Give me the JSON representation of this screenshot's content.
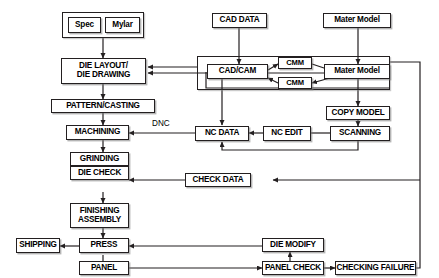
{
  "diagram": {
    "type": "flowchart",
    "colors": {
      "background": "#ffffff",
      "stroke": "#231f20",
      "text": "#000000",
      "shadow": "#8c8c8c"
    },
    "annotations": [
      {
        "id": "dnc",
        "text": "DNC"
      }
    ],
    "nodes": [
      {
        "id": "spec",
        "label": "Spec"
      },
      {
        "id": "mylar",
        "label": "Mylar"
      },
      {
        "id": "die-layout",
        "label_line1": "DIE LAYOUT/",
        "label_line2": "DIE DRAWING"
      },
      {
        "id": "pattern-casting",
        "label": "PATTERN/CASTING"
      },
      {
        "id": "machining",
        "label": "MACHINING"
      },
      {
        "id": "grinding",
        "label": "GRINDING"
      },
      {
        "id": "die-check",
        "label": "DIE CHECK"
      },
      {
        "id": "finishing",
        "label_line1": "FINISHING",
        "label_line2": "ASSEMBLY"
      },
      {
        "id": "shipping",
        "label": "SHIPPING"
      },
      {
        "id": "press",
        "label": "PRESS"
      },
      {
        "id": "panel",
        "label": "PANEL"
      },
      {
        "id": "cad-data",
        "label": "CAD DATA"
      },
      {
        "id": "mater-model-top",
        "label": "Mater Model"
      },
      {
        "id": "cad-cam",
        "label": "CAD/CAM"
      },
      {
        "id": "cmm-upper",
        "label": "CMM"
      },
      {
        "id": "cmm-lower",
        "label": "CMM"
      },
      {
        "id": "mater-model-mid",
        "label": "Mater Model"
      },
      {
        "id": "copy-model",
        "label": "COPY MODEL"
      },
      {
        "id": "scanning",
        "label": "SCANNING"
      },
      {
        "id": "nc-edit",
        "label": "NC EDIT"
      },
      {
        "id": "nc-data",
        "label": "NC DATA"
      },
      {
        "id": "check-data",
        "label": "CHECK DATA"
      },
      {
        "id": "die-modify",
        "label": "DIE MODIFY"
      },
      {
        "id": "panel-check",
        "label": "PANEL CHECK"
      },
      {
        "id": "checking-failure",
        "label": "CHECKING FAILURE"
      }
    ],
    "edges": [
      {
        "from": "spec-mylar-group",
        "to": "die-layout"
      },
      {
        "from": "die-layout",
        "to": "pattern-casting"
      },
      {
        "from": "pattern-casting",
        "to": "machining"
      },
      {
        "from": "machining",
        "to": "grinding"
      },
      {
        "from": "grinding",
        "to": "die-check"
      },
      {
        "from": "die-check",
        "to": "finishing"
      },
      {
        "from": "finishing",
        "to": "press"
      },
      {
        "from": "press",
        "to": "shipping"
      },
      {
        "from": "press",
        "to": "panel"
      },
      {
        "from": "panel",
        "to": "panel-check"
      },
      {
        "from": "panel-check",
        "to": "die-modify"
      },
      {
        "from": "panel-check",
        "to": "checking-failure"
      },
      {
        "from": "die-modify",
        "to": "press"
      },
      {
        "from": "cad-data",
        "to": "cad-cam"
      },
      {
        "from": "mater-model-top",
        "to": "mater-model-mid"
      },
      {
        "from": "cad-cam",
        "to": "cmm-upper"
      },
      {
        "from": "cmm-upper",
        "to": "mater-model-mid"
      },
      {
        "from": "mater-model-mid",
        "to": "cmm-lower"
      },
      {
        "from": "cmm-lower",
        "to": "cad-cam"
      },
      {
        "from": "cad-cam",
        "to": "nc-data"
      },
      {
        "from": "cad-cam-group",
        "to": "die-layout"
      },
      {
        "from": "mater-model-mid",
        "to": "copy-model"
      },
      {
        "from": "copy-model",
        "to": "scanning"
      },
      {
        "from": "scanning",
        "to": "nc-edit"
      },
      {
        "from": "nc-edit",
        "to": "nc-data"
      },
      {
        "from": "scanning",
        "to": "nc-data",
        "style": "feedback-loop"
      },
      {
        "from": "nc-data",
        "to": "machining",
        "label": "DNC"
      },
      {
        "from": "checking-failure",
        "to": "check-data",
        "style": "right-bus"
      },
      {
        "from": "check-data",
        "to": "die-check"
      }
    ]
  }
}
